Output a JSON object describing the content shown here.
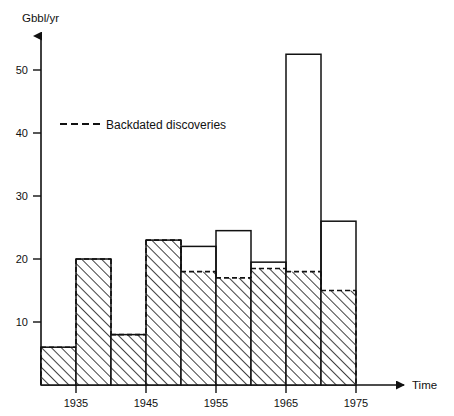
{
  "chart_data": {
    "type": "bar",
    "title": "",
    "subtitle": "",
    "xlabel": "Time",
    "ylabel": "Gbbl/yr",
    "xlim": [
      1930,
      1978
    ],
    "ylim": [
      0,
      56
    ],
    "grid": false,
    "legend_position": "upper-left-inside",
    "x_tick_labels": [
      "1935",
      "1945",
      "1955",
      "1965",
      "1975"
    ],
    "x_tick_values": [
      1935,
      1945,
      1955,
      1965,
      1975
    ],
    "y_tick_labels": [
      "10",
      "20",
      "30",
      "40",
      "50"
    ],
    "y_tick_values": [
      10,
      20,
      30,
      40,
      50
    ],
    "bar_interval_years": 5,
    "categories": [
      "1930-1935",
      "1935-1940",
      "1940-1945",
      "1945-1950",
      "1950-1955",
      "1955-1960",
      "1960-1965",
      "1965-1970",
      "1970-1975"
    ],
    "bin_starts": [
      1930,
      1935,
      1940,
      1945,
      1950,
      1955,
      1960,
      1965,
      1970
    ],
    "bin_ends": [
      1935,
      1940,
      1945,
      1950,
      1955,
      1960,
      1965,
      1970,
      1975
    ],
    "series": [
      {
        "name": "Total (bar outline)",
        "style": "solid-outline",
        "values": [
          6,
          20,
          8,
          23,
          22,
          24.5,
          19.5,
          52.5,
          26
        ]
      },
      {
        "name": "Backdated discoveries",
        "style": "dashed-top-hatched",
        "values": [
          6,
          20,
          8,
          23,
          18,
          17,
          18.5,
          18,
          15
        ]
      }
    ],
    "legend": [
      {
        "label": "Backdated discoveries",
        "marker": "dashed-line"
      }
    ],
    "annotations": []
  },
  "axes": {
    "y_axis_unit_label": "Gbbl/yr",
    "x_axis_name": "Time",
    "arrow_heads": {
      "y": true,
      "x": true
    }
  },
  "colors": {
    "ink": "#111111",
    "background": "#ffffff",
    "hatch": "#111111"
  }
}
